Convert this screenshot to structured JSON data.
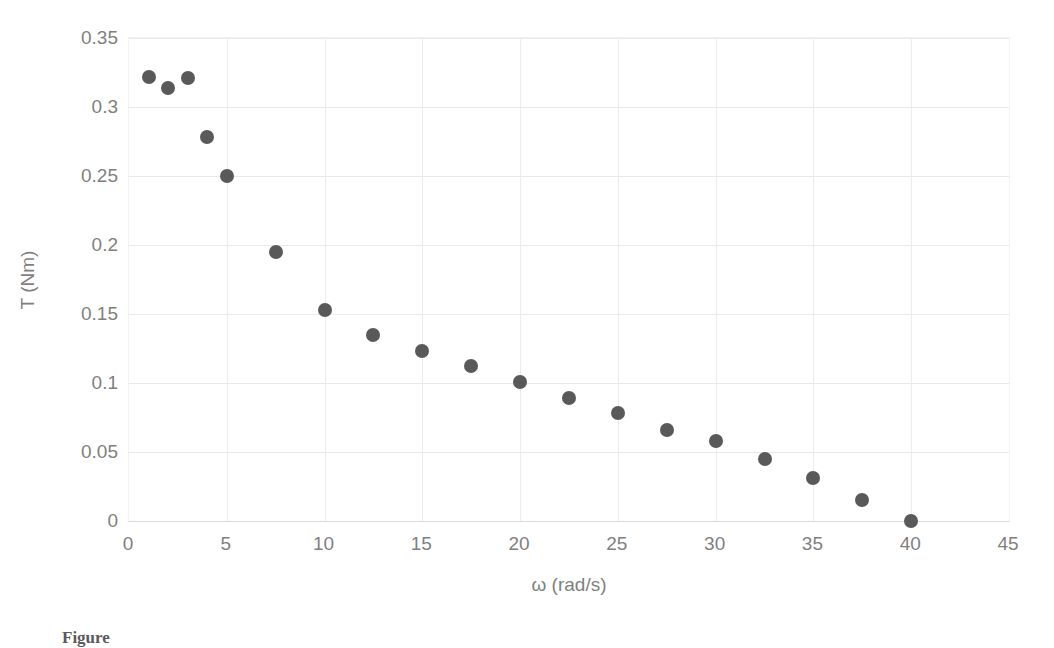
{
  "chart_data": {
    "type": "scatter",
    "title": "",
    "xlabel": "ω (rad/s)",
    "ylabel": "T (Nm)",
    "xlim": [
      0,
      45
    ],
    "ylim": [
      0,
      0.35
    ],
    "grid": true,
    "legend": false,
    "marker_color": "#595959",
    "gridline_color": "#e9e9e9",
    "axis_color": "#d9d9d9",
    "tick_label_color": "#7f7f7f",
    "xticks": [
      "0",
      "5",
      "10",
      "15",
      "20",
      "25",
      "30",
      "35",
      "40",
      "45"
    ],
    "xtick_values": [
      0,
      5,
      10,
      15,
      20,
      25,
      30,
      35,
      40,
      45
    ],
    "yticks": [
      "0",
      "0.05",
      "0.1",
      "0.15",
      "0.2",
      "0.25",
      "0.3",
      "0.35"
    ],
    "ytick_values": [
      0,
      0.05,
      0.1,
      0.15,
      0.2,
      0.25,
      0.3,
      0.35
    ],
    "series": [
      {
        "name": "Torque vs angular speed",
        "points": [
          [
            1.0,
            0.322
          ],
          [
            2.0,
            0.314
          ],
          [
            3.0,
            0.321
          ],
          [
            4.0,
            0.278
          ],
          [
            5.0,
            0.25
          ],
          [
            7.5,
            0.195
          ],
          [
            10.0,
            0.153
          ],
          [
            12.5,
            0.135
          ],
          [
            15.0,
            0.123
          ],
          [
            17.5,
            0.112
          ],
          [
            20.0,
            0.101
          ],
          [
            22.5,
            0.089
          ],
          [
            25.0,
            0.078
          ],
          [
            27.5,
            0.066
          ],
          [
            30.0,
            0.058
          ],
          [
            32.5,
            0.045
          ],
          [
            35.0,
            0.031
          ],
          [
            37.5,
            0.015
          ],
          [
            40.0,
            0.0
          ]
        ]
      }
    ]
  },
  "caption": {
    "text": "Figure"
  }
}
